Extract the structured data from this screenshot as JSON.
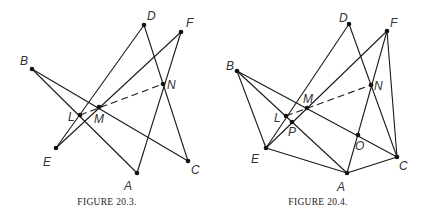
{
  "figures": [
    {
      "caption": "FIGURE 20.3.",
      "points": {
        "D": {
          "x": 144,
          "y": 25,
          "label": "D",
          "lx": 147,
          "ly": 20
        },
        "F": {
          "x": 181,
          "y": 32,
          "label": "F",
          "lx": 186,
          "ly": 27
        },
        "B": {
          "x": 32,
          "y": 69,
          "label": "B",
          "lx": 20,
          "ly": 65
        },
        "N": {
          "x": 163,
          "y": 84,
          "label": "N",
          "lx": 167,
          "ly": 89
        },
        "M": {
          "x": 99,
          "y": 107,
          "label": "M",
          "lx": 94,
          "ly": 123
        },
        "L": {
          "x": 80,
          "y": 115,
          "label": "L",
          "lx": 68,
          "ly": 121
        },
        "E": {
          "x": 56,
          "y": 148,
          "label": "E",
          "lx": 43,
          "ly": 166
        },
        "C": {
          "x": 188,
          "y": 161,
          "label": "C",
          "lx": 191,
          "ly": 174
        },
        "A": {
          "x": 137,
          "y": 173,
          "label": "A",
          "lx": 124,
          "ly": 190
        }
      },
      "segments": [
        [
          "E",
          "D"
        ],
        [
          "D",
          "C"
        ],
        [
          "E",
          "F"
        ],
        [
          "F",
          "A"
        ],
        [
          "B",
          "A"
        ],
        [
          "B",
          "C"
        ]
      ],
      "dashed": [
        [
          "L",
          "N"
        ]
      ],
      "dots": [
        "D",
        "F",
        "B",
        "N",
        "M",
        "L",
        "E",
        "C",
        "A"
      ]
    },
    {
      "caption": "FIGURE 20.4.",
      "points": {
        "D": {
          "x": 349,
          "y": 24,
          "label": "D",
          "lx": 339,
          "ly": 22
        },
        "F": {
          "x": 387,
          "y": 31,
          "label": "F",
          "lx": 390,
          "ly": 27
        },
        "B": {
          "x": 237,
          "y": 71,
          "label": "B",
          "lx": 226,
          "ly": 70
        },
        "N": {
          "x": 371,
          "y": 85,
          "label": "N",
          "lx": 374,
          "ly": 90
        },
        "M": {
          "x": 307,
          "y": 108,
          "label": "M",
          "lx": 303,
          "ly": 103
        },
        "L": {
          "x": 286,
          "y": 116,
          "label": "L",
          "lx": 274,
          "ly": 122
        },
        "P": {
          "x": 292,
          "y": 122,
          "label": "P",
          "lx": 288,
          "ly": 136
        },
        "O": {
          "x": 358,
          "y": 135,
          "label": "O",
          "lx": 355,
          "ly": 150
        },
        "E": {
          "x": 266,
          "y": 148,
          "label": "E",
          "lx": 251,
          "ly": 163
        },
        "C": {
          "x": 397,
          "y": 157,
          "label": "C",
          "lx": 399,
          "ly": 170
        },
        "A": {
          "x": 347,
          "y": 173,
          "label": "A",
          "lx": 337,
          "ly": 191
        }
      },
      "segments": [
        [
          "E",
          "D"
        ],
        [
          "D",
          "C"
        ],
        [
          "E",
          "F"
        ],
        [
          "F",
          "A"
        ],
        [
          "F",
          "C"
        ],
        [
          "B",
          "A"
        ],
        [
          "B",
          "C"
        ],
        [
          "B",
          "E"
        ],
        [
          "E",
          "A"
        ],
        [
          "A",
          "C"
        ]
      ],
      "dashed": [
        [
          "L",
          "N"
        ]
      ],
      "dots": [
        "D",
        "F",
        "B",
        "N",
        "M",
        "L",
        "P",
        "O",
        "E",
        "C",
        "A"
      ]
    }
  ],
  "caption_positions": [
    {
      "x": 107,
      "y": 205
    },
    {
      "x": 318,
      "y": 205
    }
  ]
}
